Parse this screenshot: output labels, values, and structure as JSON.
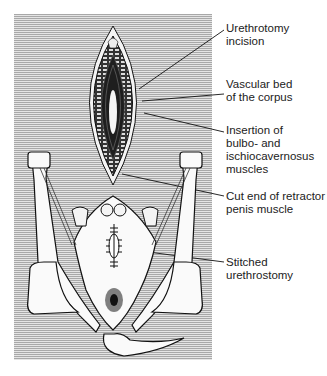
{
  "figure": {
    "labels": [
      {
        "id": "urethrotomy-incision",
        "text": "Urethrotomy\nincision",
        "top": 22
      },
      {
        "id": "vascular-bed",
        "text": "Vascular bed\nof the corpus",
        "top": 78
      },
      {
        "id": "muscle-insertion",
        "text": "Insertion of\nbulbo- and\nischiocavernosus\nmuscles",
        "top": 124
      },
      {
        "id": "retractor-penis",
        "text": "Cut end of retractor\npenis muscle",
        "top": 190
      },
      {
        "id": "stitched-urethrostomy",
        "text": "Stitched\nurethrostomy",
        "top": 256
      }
    ]
  },
  "colors": {
    "panel": "#c8c8c8",
    "line": "#111111",
    "incision_dark": "#2a2a2a"
  }
}
